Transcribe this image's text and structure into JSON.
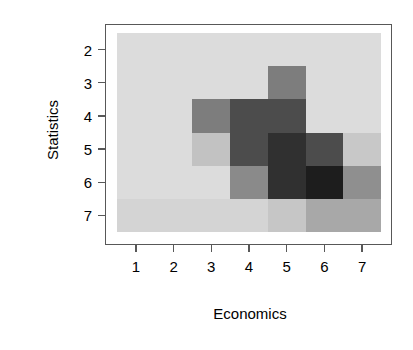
{
  "chart_data": {
    "type": "heatmap",
    "title": "",
    "xlabel": "Economics",
    "ylabel": "Statistics",
    "x_categories": [
      "1",
      "2",
      "3",
      "4",
      "5",
      "6",
      "7"
    ],
    "y_categories": [
      "2",
      "3",
      "4",
      "5",
      "6",
      "7"
    ],
    "x_tick_labels": [
      "1",
      "2",
      "3",
      "4",
      "5",
      "6",
      "7"
    ],
    "y_tick_labels": [
      "2",
      "3",
      "4",
      "5",
      "6",
      "7"
    ],
    "xlim": [
      0.5,
      7.5
    ],
    "ylim": [
      7.5,
      1.5
    ],
    "y_axis_inverted": true,
    "grid": false,
    "legend": "none",
    "colormap": "grayscale",
    "background_color": "#d8d8d8",
    "frame_color": "#585858",
    "min_color": "#dcdcdc",
    "max_color": "#1d1d1d",
    "cells": [
      {
        "x": "1",
        "y": "2",
        "value": 0,
        "color": "#dcdcdc"
      },
      {
        "x": "2",
        "y": "2",
        "value": 0,
        "color": "#dcdcdc"
      },
      {
        "x": "3",
        "y": "2",
        "value": 0,
        "color": "#dcdcdc"
      },
      {
        "x": "4",
        "y": "2",
        "value": 0,
        "color": "#dcdcdc"
      },
      {
        "x": "5",
        "y": "2",
        "value": 0,
        "color": "#dcdcdc"
      },
      {
        "x": "6",
        "y": "2",
        "value": 0,
        "color": "#dcdcdc"
      },
      {
        "x": "7",
        "y": "2",
        "value": 0,
        "color": "#dcdcdc"
      },
      {
        "x": "1",
        "y": "3",
        "value": 0,
        "color": "#dcdcdc"
      },
      {
        "x": "2",
        "y": "3",
        "value": 0,
        "color": "#dcdcdc"
      },
      {
        "x": "3",
        "y": "3",
        "value": 0,
        "color": "#dcdcdc"
      },
      {
        "x": "4",
        "y": "3",
        "value": 0,
        "color": "#dcdcdc"
      },
      {
        "x": "5",
        "y": "3",
        "value": 3,
        "color": "#7d7d7d"
      },
      {
        "x": "6",
        "y": "3",
        "value": 0,
        "color": "#dcdcdc"
      },
      {
        "x": "7",
        "y": "3",
        "value": 0,
        "color": "#dcdcdc"
      },
      {
        "x": "1",
        "y": "4",
        "value": 0,
        "color": "#dcdcdc"
      },
      {
        "x": "2",
        "y": "4",
        "value": 0,
        "color": "#dcdcdc"
      },
      {
        "x": "3",
        "y": "4",
        "value": 3,
        "color": "#7d7d7d"
      },
      {
        "x": "4",
        "y": "4",
        "value": 5,
        "color": "#4c4c4c"
      },
      {
        "x": "5",
        "y": "4",
        "value": 5,
        "color": "#4c4c4c"
      },
      {
        "x": "6",
        "y": "4",
        "value": 0,
        "color": "#dcdcdc"
      },
      {
        "x": "7",
        "y": "4",
        "value": 0,
        "color": "#dcdcdc"
      },
      {
        "x": "1",
        "y": "5",
        "value": 0,
        "color": "#dcdcdc"
      },
      {
        "x": "2",
        "y": "5",
        "value": 0,
        "color": "#dcdcdc"
      },
      {
        "x": "3",
        "y": "5",
        "value": 1,
        "color": "#c2c2c2"
      },
      {
        "x": "4",
        "y": "5",
        "value": 5,
        "color": "#4c4c4c"
      },
      {
        "x": "5",
        "y": "5",
        "value": 6,
        "color": "#303030"
      },
      {
        "x": "6",
        "y": "5",
        "value": 5,
        "color": "#4c4c4c"
      },
      {
        "x": "7",
        "y": "5",
        "value": 1,
        "color": "#c8c8c8"
      },
      {
        "x": "1",
        "y": "6",
        "value": 0,
        "color": "#dcdcdc"
      },
      {
        "x": "2",
        "y": "6",
        "value": 0,
        "color": "#dcdcdc"
      },
      {
        "x": "3",
        "y": "6",
        "value": 0,
        "color": "#dcdcdc"
      },
      {
        "x": "4",
        "y": "6",
        "value": 3,
        "color": "#8a8a8a"
      },
      {
        "x": "5",
        "y": "6",
        "value": 6,
        "color": "#303030"
      },
      {
        "x": "6",
        "y": "6",
        "value": 7,
        "color": "#1d1d1d"
      },
      {
        "x": "7",
        "y": "6",
        "value": 3,
        "color": "#8f8f8f"
      },
      {
        "x": "1",
        "y": "7",
        "value": 0,
        "color": "#d4d4d4"
      },
      {
        "x": "2",
        "y": "7",
        "value": 0,
        "color": "#d4d4d4"
      },
      {
        "x": "3",
        "y": "7",
        "value": 0,
        "color": "#d4d4d4"
      },
      {
        "x": "4",
        "y": "7",
        "value": 0,
        "color": "#d4d4d4"
      },
      {
        "x": "5",
        "y": "7",
        "value": 1,
        "color": "#c6c6c6"
      },
      {
        "x": "6",
        "y": "7",
        "value": 2,
        "color": "#a8a8a8"
      },
      {
        "x": "7",
        "y": "7",
        "value": 2,
        "color": "#a8a8a8"
      }
    ]
  }
}
